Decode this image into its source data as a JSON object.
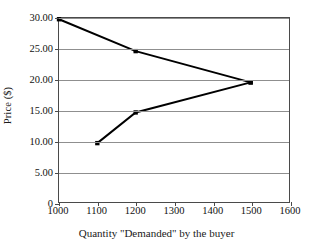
{
  "chart_data": {
    "type": "line",
    "title": "",
    "xlabel": "Quantity \"Demanded\" by the buyer",
    "ylabel": "Price ($)",
    "xlim": [
      1000,
      1600
    ],
    "ylim": [
      0,
      30
    ],
    "xticks": [
      "1000",
      "1100",
      "1200",
      "1300",
      "1400",
      "1500",
      "1600"
    ],
    "xtick_values": [
      1000,
      1100,
      1200,
      1300,
      1400,
      1500,
      1600
    ],
    "yticks": [
      "0",
      "5.00",
      "10.00",
      "15.00",
      "20.00",
      "25.00",
      "30.00"
    ],
    "ytick_values": [
      0,
      5,
      10,
      15,
      20,
      25,
      30
    ],
    "grid": true,
    "grid_axis": "y",
    "legend": "none",
    "series": [
      {
        "name": "upper-branch",
        "x": [
          1000,
          1200,
          1500
        ],
        "values": [
          29.8,
          24.6,
          19.5
        ]
      },
      {
        "name": "lower-branch",
        "x": [
          1100,
          1200,
          1500
        ],
        "values": [
          9.6,
          14.6,
          19.5
        ]
      }
    ],
    "line_color": "#000000",
    "marker": "square",
    "marker_color": "#000000",
    "grid_color": "#8f8f8f",
    "frame_color": "#4a4a4a",
    "background_color": "#ffffff"
  }
}
